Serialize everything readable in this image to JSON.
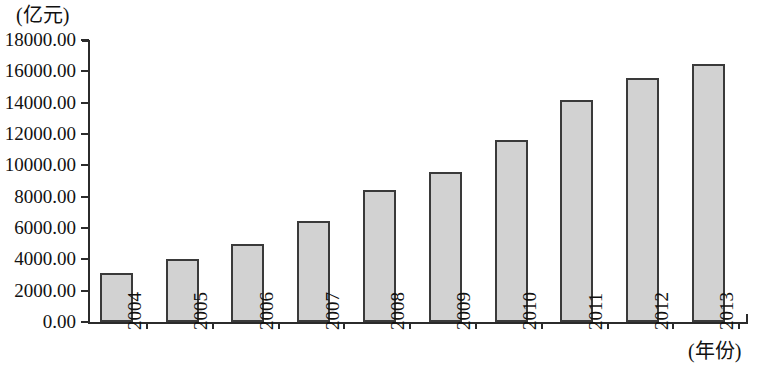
{
  "chart_data": {
    "type": "bar",
    "title": "",
    "subtitle": "",
    "xlabel": "(年份)",
    "ylabel": "(亿元)",
    "categories": [
      "2004",
      "2005",
      "2006",
      "2007",
      "2008",
      "2009",
      "2010",
      "2011",
      "2012",
      "2013"
    ],
    "values": [
      3100,
      4000,
      4950,
      6450,
      8450,
      9600,
      11600,
      14200,
      15600,
      16500
    ],
    "series": [
      {
        "name": "",
        "values": [
          3100,
          4000,
          4950,
          6450,
          8450,
          9600,
          11600,
          14200,
          15600,
          16500
        ]
      }
    ],
    "ylim": [
      0,
      18000
    ],
    "ytick_values": [
      0,
      2000,
      4000,
      6000,
      8000,
      10000,
      12000,
      14000,
      16000,
      18000
    ],
    "ytick_labels": [
      "0.00",
      "2000.00",
      "4000.00",
      "6000.00",
      "8000.00",
      "10000.00",
      "12000.00",
      "14000.00",
      "16000.00",
      "18000.00"
    ],
    "grid": false,
    "legend": false,
    "legend_position": "none",
    "bar_fill_color": "#d2d2d2",
    "bar_border_color": "#3a3a3a",
    "axis_color": "#2b2b2b",
    "background_color": "#ffffff"
  }
}
